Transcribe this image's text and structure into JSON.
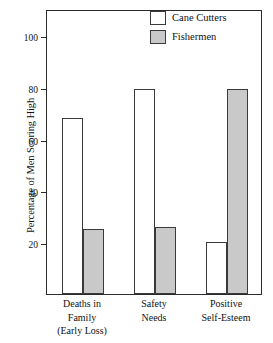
{
  "chart_data": {
    "type": "bar",
    "title": "",
    "subtitle": "",
    "xlabel": "",
    "ylabel": "Percentage of Men Scoring High",
    "ylim": [
      0,
      110
    ],
    "yticks": [
      20,
      40,
      60,
      80,
      100
    ],
    "ytick_labels": [
      "20",
      "40",
      "60",
      "80",
      "100"
    ],
    "grid": false,
    "legend_position": "top-right",
    "categories": [
      "Deaths in Family (Early Loss)",
      "Safety Needs",
      "Positive Self-Esteem"
    ],
    "category_lines": [
      [
        "Deaths in",
        "Family",
        "(Early Loss)"
      ],
      [
        "Safety",
        "Needs"
      ],
      [
        "Positive",
        "Self-Esteem"
      ]
    ],
    "series": [
      {
        "name": "Cane Cutters",
        "values": [
          68,
          79,
          20
        ],
        "color": "#ffffff"
      },
      {
        "name": "Fishermen",
        "values": [
          25,
          26,
          79
        ],
        "color": "#c9c9c9"
      }
    ]
  },
  "legend": {
    "items": [
      {
        "label": "Cane Cutters",
        "swatch": "white-square-swatch"
      },
      {
        "label": "Fishermen",
        "swatch": "gray-square-swatch"
      }
    ]
  },
  "axis": {
    "y_title": "Percentage of Men Scoring High"
  }
}
